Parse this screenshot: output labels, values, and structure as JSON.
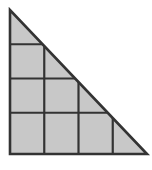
{
  "figure": {
    "name": "gridded-right-triangle",
    "title": "Right triangle subdivided by a square grid",
    "background_color": "#ffffff",
    "fill_color": "#c8c8c8",
    "stroke_color": "#333333",
    "outline_stroke_width": 2.6,
    "grid_stroke_width": 2.2,
    "vertices": {
      "apex": [
        10,
        10
      ],
      "right_angle": [
        10,
        154
      ],
      "base_right": [
        147,
        154
      ]
    },
    "leg_length_px": 144,
    "grid": {
      "cells_per_side": 4,
      "cell_size_px": 34.25,
      "vertical_line_x": [
        44.25,
        78.5,
        112.75
      ],
      "horizontal_line_y": [
        44.25,
        78.5,
        112.75
      ]
    },
    "counts": {
      "full_squares": 6,
      "half_triangles": 4,
      "rows": [
        1,
        2,
        3
      ]
    },
    "labels": {
      "shape": "right triangle",
      "orientation": "vertical leg on left, horizontal leg on bottom, hypotenuse from top-left to bottom-right"
    }
  }
}
